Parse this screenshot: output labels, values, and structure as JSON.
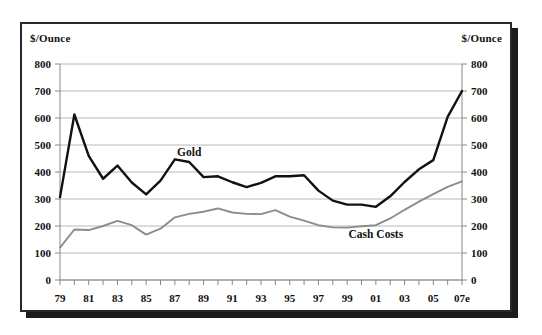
{
  "figure": {
    "y_axis_title_left": "$/Ounce",
    "y_axis_title_right": "$/Ounce",
    "series_label_gold": "Gold",
    "series_label_cash_costs": "Cash Costs",
    "colors": {
      "gold_line": "#111111",
      "cash_costs_line": "#8c8c8c",
      "gridline": "#b8b8b8",
      "axis": "#888888",
      "frame": "#2a2a2a",
      "shadow": "#1c1c1c",
      "background": "#ffffff",
      "text": "#111111"
    }
  },
  "chart_data": {
    "type": "line",
    "title": "",
    "subtitle": "",
    "xlabel": "",
    "ylabel": "$/Ounce",
    "ylabel_right": "$/Ounce",
    "grid": true,
    "legend": "inline-annotations",
    "ylim": [
      0,
      800
    ],
    "ytick_labels": [
      "0",
      "100",
      "200",
      "300",
      "400",
      "500",
      "600",
      "700",
      "800"
    ],
    "yticks": [
      0,
      100,
      200,
      300,
      400,
      500,
      600,
      700,
      800
    ],
    "xtick_labels": [
      "79",
      "",
      "81",
      "",
      "83",
      "",
      "85",
      "",
      "87",
      "",
      "89",
      "",
      "91",
      "",
      "93",
      "",
      "95",
      "",
      "97",
      "",
      "99",
      "",
      "01",
      "",
      "03",
      "",
      "05",
      "",
      "07e"
    ],
    "x": [
      "79",
      "80",
      "81",
      "82",
      "83",
      "84",
      "85",
      "86",
      "87",
      "88",
      "89",
      "90",
      "91",
      "92",
      "93",
      "94",
      "95",
      "96",
      "97",
      "98",
      "99",
      "00",
      "01",
      "02",
      "03",
      "04",
      "05",
      "06",
      "07e"
    ],
    "series": [
      {
        "name": "Gold",
        "color": "#111111",
        "values": [
          307,
          613,
          460,
          375,
          424,
          361,
          317,
          368,
          447,
          437,
          381,
          384,
          362,
          344,
          360,
          384,
          384,
          388,
          331,
          294,
          279,
          279,
          271,
          310,
          363,
          410,
          444,
          604,
          700
        ]
      },
      {
        "name": "Cash Costs",
        "color": "#8c8c8c",
        "values": [
          120,
          187,
          185,
          200,
          219,
          203,
          168,
          190,
          232,
          245,
          253,
          265,
          250,
          245,
          244,
          259,
          235,
          220,
          203,
          195,
          194,
          199,
          203,
          228,
          260,
          290,
          318,
          345,
          365
        ]
      }
    ],
    "annotations": [
      {
        "text": "Gold",
        "x": "88",
        "y": 460
      },
      {
        "text": "Cash Costs",
        "x": "01",
        "y": 155
      }
    ]
  }
}
